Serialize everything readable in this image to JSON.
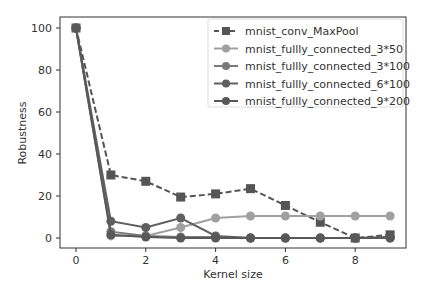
{
  "chart_data": {
    "type": "line",
    "title": "",
    "xlabel": "Kernel size",
    "ylabel": "Robustness",
    "x": [
      0,
      1,
      2,
      3,
      4,
      5,
      6,
      7,
      8,
      9
    ],
    "xlim": [
      -0.45,
      9.45
    ],
    "ylim": [
      -5,
      105
    ],
    "xticks": [
      0,
      2,
      4,
      6,
      8
    ],
    "yticks": [
      0,
      20,
      40,
      60,
      80,
      100
    ],
    "grid": false,
    "legend_position": "upper right",
    "series": [
      {
        "name": "mnist_conv_MaxPool",
        "marker": "square",
        "linestyle": "dashed",
        "color": "#555555",
        "values": [
          100,
          30,
          27,
          19.5,
          21,
          23.5,
          15.5,
          7.5,
          0,
          1.5
        ]
      },
      {
        "name": "mnist_fullly_connected_3*50",
        "marker": "circle",
        "linestyle": "solid",
        "color": "#a0a0a0",
        "values": [
          100,
          1,
          1,
          5,
          9.5,
          10.5,
          10.5,
          10.5,
          10.5,
          10.5
        ]
      },
      {
        "name": "mnist_fullly_connected_3*100",
        "marker": "circle",
        "linestyle": "solid",
        "color": "#7a7a7a",
        "values": [
          100,
          3,
          1,
          0.5,
          0.5,
          0,
          0,
          0,
          0,
          0
        ]
      },
      {
        "name": "mnist_fullly_connected_6*100",
        "marker": "circle",
        "linestyle": "solid",
        "color": "#606060",
        "values": [
          100,
          8,
          5,
          9.5,
          1,
          0,
          0,
          0,
          0,
          0
        ]
      },
      {
        "name": "mnist_fullly_connected_9*200",
        "marker": "circle",
        "linestyle": "solid",
        "color": "#585858",
        "values": [
          100,
          1.5,
          0.5,
          0,
          0,
          0,
          0,
          0,
          0,
          0.5
        ]
      }
    ]
  }
}
